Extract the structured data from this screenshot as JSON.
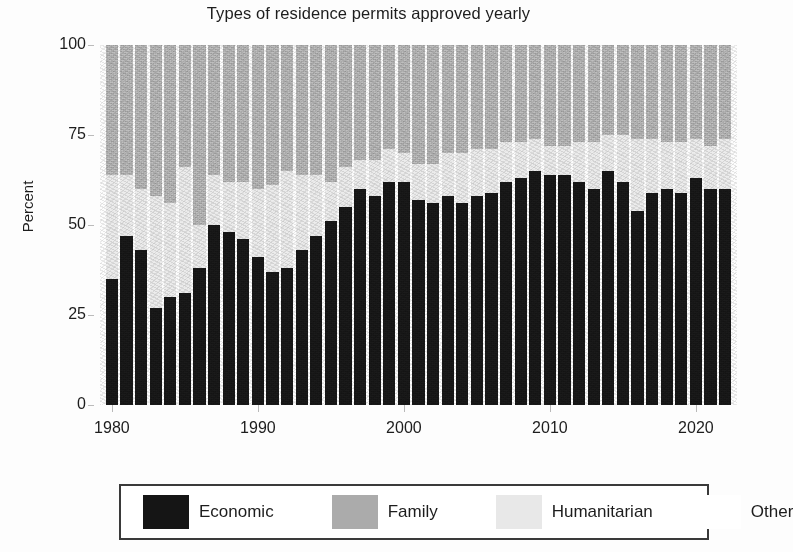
{
  "chart_data": {
    "type": "bar",
    "subtype": "stacked-bar-100",
    "title": "Types of residence permits approved yearly",
    "xlabel": "",
    "ylabel": "Percent",
    "ylim": [
      0,
      100
    ],
    "yticks": [
      0,
      25,
      50,
      75,
      100
    ],
    "xticks": [
      1980,
      1990,
      2000,
      2010,
      2020
    ],
    "grid": false,
    "legend_position": "bottom",
    "x": [
      1980,
      1981,
      1982,
      1983,
      1984,
      1985,
      1986,
      1987,
      1988,
      1989,
      1990,
      1991,
      1992,
      1993,
      1994,
      1995,
      1996,
      1997,
      1998,
      1999,
      2000,
      2001,
      2002,
      2003,
      2004,
      2005,
      2006,
      2007,
      2008,
      2009,
      2010,
      2011,
      2012,
      2013,
      2014,
      2015,
      2016,
      2017,
      2018,
      2019,
      2020,
      2021,
      2022
    ],
    "categories": [
      "1980",
      "1981",
      "1982",
      "1983",
      "1984",
      "1985",
      "1986",
      "1987",
      "1988",
      "1989",
      "1990",
      "1991",
      "1992",
      "1993",
      "1994",
      "1995",
      "1996",
      "1997",
      "1998",
      "1999",
      "2000",
      "2001",
      "2002",
      "2003",
      "2004",
      "2005",
      "2006",
      "2007",
      "2008",
      "2009",
      "2010",
      "2011",
      "2012",
      "2013",
      "2014",
      "2015",
      "2016",
      "2017",
      "2018",
      "2019",
      "2020",
      "2021",
      "2022"
    ],
    "series": [
      {
        "name": "Economic",
        "color": "#161616",
        "values": [
          35,
          47,
          43,
          27,
          30,
          31,
          38,
          50,
          48,
          46,
          41,
          37,
          38,
          43,
          47,
          51,
          55,
          60,
          58,
          62,
          62,
          57,
          56,
          58,
          56,
          58,
          59,
          62,
          63,
          65,
          64,
          64,
          62,
          60,
          65,
          62,
          54,
          59,
          60,
          59,
          63,
          60,
          60
        ]
      },
      {
        "name": "Humanitarian",
        "color": "#e9e9e9",
        "values": [
          29,
          17,
          17,
          31,
          26,
          35,
          12,
          14,
          14,
          16,
          19,
          24,
          27,
          21,
          17,
          11,
          11,
          8,
          10,
          9,
          8,
          10,
          11,
          12,
          14,
          13,
          12,
          11,
          10,
          9,
          8,
          8,
          11,
          13,
          10,
          13,
          20,
          15,
          13,
          14,
          11,
          12,
          14
        ]
      },
      {
        "name": "Family",
        "color": "#adadad",
        "values": [
          36,
          36,
          40,
          42,
          44,
          34,
          50,
          36,
          38,
          38,
          40,
          39,
          35,
          36,
          36,
          38,
          34,
          32,
          32,
          29,
          30,
          33,
          33,
          30,
          30,
          29,
          29,
          27,
          27,
          26,
          28,
          28,
          27,
          27,
          25,
          25,
          26,
          26,
          27,
          27,
          26,
          28,
          26
        ]
      },
      {
        "name": "Other",
        "color": "#fcfcfc",
        "values": [
          0,
          0,
          0,
          0,
          0,
          0,
          0,
          0,
          0,
          0,
          0,
          0,
          0,
          0,
          0,
          0,
          0,
          0,
          0,
          0,
          0,
          0,
          0,
          0,
          0,
          0,
          0,
          0,
          0,
          0,
          0,
          0,
          0,
          0,
          0,
          0,
          0,
          0,
          0,
          0,
          0,
          0,
          0
        ]
      }
    ],
    "legend_entries": [
      {
        "label": "Economic",
        "color": "#151515"
      },
      {
        "label": "Family",
        "color": "#ababab"
      },
      {
        "label": "Humanitarian",
        "color": "#e8e8e8"
      },
      {
        "label": "Other",
        "color": "#ffffff"
      }
    ]
  },
  "axes": {
    "y_title": "Percent",
    "y_tick_labels": [
      "100",
      "75",
      "50",
      "25",
      "0"
    ],
    "x_tick_labels": [
      "1980",
      "1990",
      "2000",
      "2010",
      "2020"
    ]
  },
  "legend": {
    "economic_label": "Economic",
    "family_label": "Family",
    "humanitarian_label": "Humanitarian",
    "other_label": "Other"
  }
}
